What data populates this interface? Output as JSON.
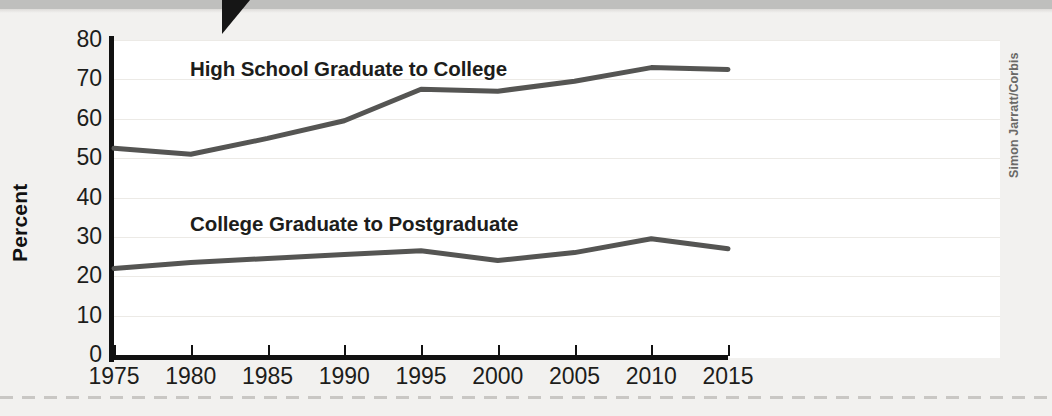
{
  "figure": {
    "background_color": "#f2f1ef",
    "plot_background_color": "#ffffff",
    "axis_color": "#111111",
    "line_color": "#555553",
    "gridline_color": "#eceae6",
    "tab_color": "#161616",
    "banner_color": "#bfbfbd"
  },
  "photo": {
    "credit": "Simon Jarratt/Corbis",
    "subject": "graduation-cap-photo"
  },
  "chart_data": {
    "type": "line",
    "title": "",
    "xlabel": "",
    "ylabel": "Percent",
    "xlim": [
      1975,
      2015
    ],
    "ylim": [
      0,
      80
    ],
    "grid": true,
    "legend_position": "inline-labels",
    "x": [
      1975,
      1980,
      1985,
      1990,
      1995,
      2000,
      2005,
      2010,
      2015
    ],
    "xtick_labels": [
      "1975",
      "1980",
      "1985",
      "1990",
      "1995",
      "2000",
      "2005",
      "2010",
      "2015"
    ],
    "ytick_labels": [
      "0",
      "10",
      "20",
      "30",
      "40",
      "50",
      "60",
      "70",
      "80"
    ],
    "yticks": [
      0,
      10,
      20,
      30,
      40,
      50,
      60,
      70,
      80
    ],
    "series": [
      {
        "name": "High School Graduate to College",
        "values": [
          52.5,
          51.0,
          55.0,
          59.5,
          67.5,
          67.0,
          69.5,
          73.0,
          72.5
        ]
      },
      {
        "name": "College Graduate to Postgraduate",
        "values": [
          22.0,
          23.5,
          24.5,
          25.5,
          26.5,
          24.0,
          26.0,
          29.5,
          27.0
        ]
      }
    ]
  }
}
